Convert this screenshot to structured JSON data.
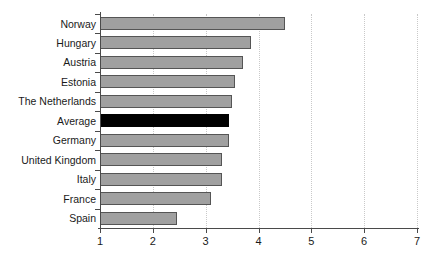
{
  "chart_data": {
    "type": "bar",
    "orientation": "horizontal",
    "title": "",
    "subtitle": "",
    "xlabel": "",
    "ylabel": "",
    "categories": [
      "Norway",
      "Hungary",
      "Austria",
      "Estonia",
      "The Netherlands",
      "Average",
      "Germany",
      "United Kingdom",
      "Italy",
      "France",
      "Spain"
    ],
    "values": [
      4.5,
      3.85,
      3.7,
      3.55,
      3.5,
      3.45,
      3.45,
      3.3,
      3.3,
      3.1,
      2.45
    ],
    "highlight_category": "Average",
    "xlim": [
      1,
      7
    ],
    "xticks": [
      1,
      2,
      3,
      4,
      5,
      6,
      7
    ],
    "xtick_labels": [
      "1",
      "2",
      "3",
      "4",
      "5",
      "6",
      "7"
    ],
    "grid": "vertical-dotted",
    "legend": "none",
    "colors": {
      "bar_fill": "#a0a0a0",
      "bar_border": "#555555",
      "highlight_fill": "#000000",
      "gridline": "#c9c9c9",
      "axis": "#4a4a4a",
      "text": "#1a1a1a",
      "background": "#ffffff"
    }
  }
}
